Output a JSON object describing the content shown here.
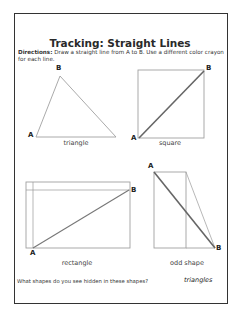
{
  "worksheet": {
    "title": "Tracking: Straight Lines",
    "directions_label": "Directions:",
    "directions_text": "Draw a straight line from A to B. Use a different color crayon for each line.",
    "shapes": [
      {
        "name": "triangle",
        "point_a": "A",
        "point_b": "B"
      },
      {
        "name": "square",
        "point_a": "A",
        "point_b": "B"
      },
      {
        "name": "rectangle",
        "point_a": "A",
        "point_b": "B"
      },
      {
        "name": "odd shape",
        "point_a": "A",
        "point_b": "B"
      }
    ],
    "question": "What shapes do you see hidden in these shapes?",
    "answer": "triangles"
  },
  "colors": {
    "shape_outline": "#9a9a9a",
    "drawn_line": "#666666",
    "border": "#333333"
  }
}
